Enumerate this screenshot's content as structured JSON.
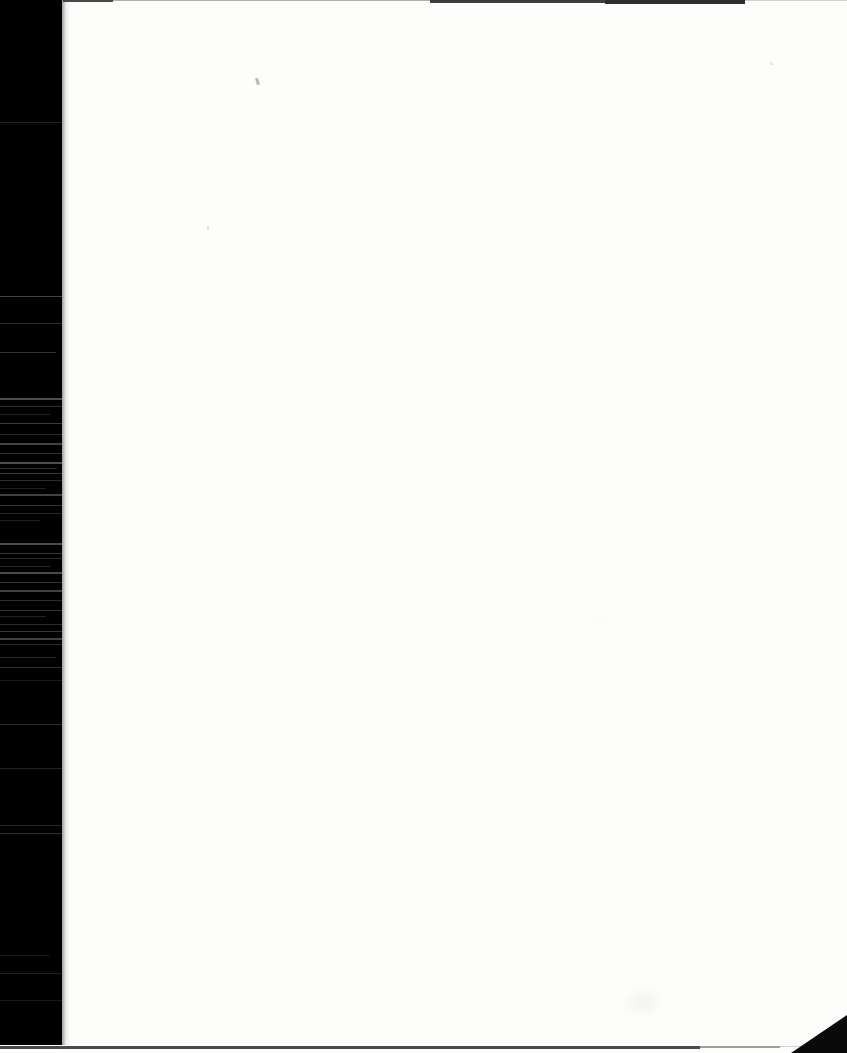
{
  "content": {
    "visible_text": ""
  },
  "colors": {
    "paper": "#fdfdfc",
    "scanner_background": "#000000",
    "top_edge_line": "#1c1c1c",
    "bottom_edge_line": "#2b2b2b",
    "corner_fold": "#0a0a0a",
    "streak": "#9a9a9a",
    "speck": "#666666"
  },
  "artifacts": {
    "left_bar": {
      "x": 0,
      "y": 0,
      "width": 62,
      "height": 1045
    },
    "top_edge_segments": [
      {
        "x": 63,
        "width": 50,
        "height": 2,
        "opacity": 0.8
      },
      {
        "x": 113,
        "width": 317,
        "height": 1,
        "opacity": 0.35
      },
      {
        "x": 430,
        "width": 175,
        "height": 3,
        "opacity": 0.85
      },
      {
        "x": 605,
        "width": 140,
        "height": 4,
        "opacity": 0.92
      },
      {
        "x": 745,
        "width": 102,
        "height": 1,
        "opacity": 0.2
      }
    ],
    "bottom_edge_segments": [
      {
        "x": 0,
        "width": 700,
        "height": 3,
        "opacity": 0.85
      },
      {
        "x": 700,
        "width": 80,
        "height": 2,
        "opacity": 0.45
      },
      {
        "x": 780,
        "width": 30,
        "height": 1,
        "opacity": 0.2
      }
    ],
    "corner_triangle": {
      "width": 56,
      "height": 38
    },
    "streaks": [
      {
        "y": 122,
        "width": 62,
        "height": 1,
        "opacity": 0.22
      },
      {
        "y": 296,
        "width": 62,
        "height": 1,
        "opacity": 0.45
      },
      {
        "y": 323,
        "width": 62,
        "height": 1,
        "opacity": 0.28
      },
      {
        "y": 352,
        "width": 56,
        "height": 1,
        "opacity": 0.32
      },
      {
        "y": 398,
        "width": 62,
        "height": 2,
        "opacity": 0.5
      },
      {
        "y": 406,
        "width": 62,
        "height": 1,
        "opacity": 0.3
      },
      {
        "y": 414,
        "width": 50,
        "height": 1,
        "opacity": 0.22
      },
      {
        "y": 423,
        "width": 62,
        "height": 1,
        "opacity": 0.38
      },
      {
        "y": 434,
        "width": 62,
        "height": 1,
        "opacity": 0.28
      },
      {
        "y": 443,
        "width": 62,
        "height": 2,
        "opacity": 0.45
      },
      {
        "y": 453,
        "width": 62,
        "height": 1,
        "opacity": 0.3
      },
      {
        "y": 462,
        "width": 62,
        "height": 2,
        "opacity": 0.5
      },
      {
        "y": 468,
        "width": 57,
        "height": 1,
        "opacity": 0.3
      },
      {
        "y": 473,
        "width": 62,
        "height": 1,
        "opacity": 0.38
      },
      {
        "y": 480,
        "width": 62,
        "height": 1,
        "opacity": 0.28
      },
      {
        "y": 488,
        "width": 46,
        "height": 1,
        "opacity": 0.22
      },
      {
        "y": 494,
        "width": 62,
        "height": 2,
        "opacity": 0.42
      },
      {
        "y": 505,
        "width": 62,
        "height": 1,
        "opacity": 0.32
      },
      {
        "y": 513,
        "width": 62,
        "height": 1,
        "opacity": 0.26
      },
      {
        "y": 520,
        "width": 40,
        "height": 1,
        "opacity": 0.2
      },
      {
        "y": 543,
        "width": 62,
        "height": 2,
        "opacity": 0.5
      },
      {
        "y": 553,
        "width": 62,
        "height": 1,
        "opacity": 0.36
      },
      {
        "y": 558,
        "width": 62,
        "height": 1,
        "opacity": 0.28
      },
      {
        "y": 566,
        "width": 50,
        "height": 1,
        "opacity": 0.28
      },
      {
        "y": 572,
        "width": 62,
        "height": 2,
        "opacity": 0.48
      },
      {
        "y": 582,
        "width": 62,
        "height": 1,
        "opacity": 0.32
      },
      {
        "y": 590,
        "width": 62,
        "height": 2,
        "opacity": 0.42
      },
      {
        "y": 600,
        "width": 62,
        "height": 1,
        "opacity": 0.28
      },
      {
        "y": 610,
        "width": 62,
        "height": 1,
        "opacity": 0.32
      },
      {
        "y": 616,
        "width": 46,
        "height": 1,
        "opacity": 0.22
      },
      {
        "y": 624,
        "width": 62,
        "height": 1,
        "opacity": 0.28
      },
      {
        "y": 631,
        "width": 62,
        "height": 1,
        "opacity": 0.36
      },
      {
        "y": 638,
        "width": 62,
        "height": 2,
        "opacity": 0.42
      },
      {
        "y": 644,
        "width": 62,
        "height": 1,
        "opacity": 0.26
      },
      {
        "y": 657,
        "width": 56,
        "height": 1,
        "opacity": 0.28
      },
      {
        "y": 667,
        "width": 62,
        "height": 1,
        "opacity": 0.3
      },
      {
        "y": 680,
        "width": 62,
        "height": 1,
        "opacity": 0.18
      },
      {
        "y": 724,
        "width": 62,
        "height": 1,
        "opacity": 0.28
      },
      {
        "y": 768,
        "width": 62,
        "height": 1,
        "opacity": 0.22
      },
      {
        "y": 825,
        "width": 62,
        "height": 1,
        "opacity": 0.26
      },
      {
        "y": 833,
        "width": 62,
        "height": 1,
        "opacity": 0.3
      },
      {
        "y": 955,
        "width": 50,
        "height": 1,
        "opacity": 0.16
      },
      {
        "y": 973,
        "width": 62,
        "height": 1,
        "opacity": 0.2
      },
      {
        "y": 1000,
        "width": 62,
        "height": 1,
        "opacity": 0.16
      }
    ],
    "specks": [
      {
        "x": 256,
        "y": 78,
        "width": 3,
        "height": 7,
        "opacity": 0.45,
        "rotate": -18,
        "blur": false
      },
      {
        "x": 207,
        "y": 226,
        "width": 2,
        "height": 3,
        "opacity": 0.18,
        "rotate": 0,
        "blur": false
      },
      {
        "x": 770,
        "y": 62,
        "width": 3,
        "height": 3,
        "opacity": 0.14,
        "rotate": 0,
        "blur": false
      },
      {
        "x": 594,
        "y": 618,
        "width": 14,
        "height": 3,
        "opacity": 0.08,
        "rotate": 0,
        "blur": true
      },
      {
        "x": 628,
        "y": 992,
        "width": 30,
        "height": 20,
        "opacity": 0.05,
        "rotate": 0,
        "blur": true
      }
    ]
  }
}
